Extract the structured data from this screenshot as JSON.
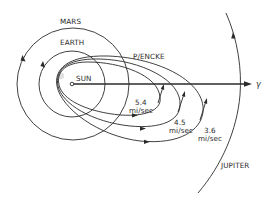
{
  "diagram": {
    "bodies": {
      "sun": "SUN",
      "earth": "EARTH",
      "mars": "MARS",
      "jupiter": "JUPITER",
      "comet": "P/ENCKE"
    },
    "vernal_equinox_symbol": "γ",
    "trajectories": [
      {
        "speed_value": "5.4",
        "speed_unit": "mi/sec"
      },
      {
        "speed_value": "4.5",
        "speed_unit": "mi/sec"
      },
      {
        "speed_value": "3.6",
        "speed_unit": "mi/sec"
      }
    ],
    "colors": {
      "line": "#2b2b2b",
      "text": "#2a2a2a",
      "background": "#ffffff"
    }
  }
}
